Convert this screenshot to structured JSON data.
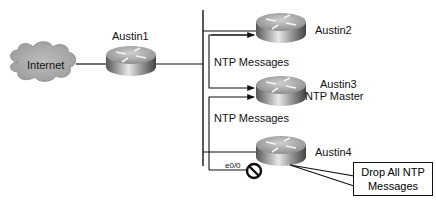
{
  "diagram": {
    "type": "network-topology",
    "nodes": {
      "internet": {
        "label": "Internet"
      },
      "austin1": {
        "label": "Austin1"
      },
      "austin2": {
        "label": "Austin2"
      },
      "austin3": {
        "label": "Austin3",
        "role": "NTP Master"
      },
      "austin4": {
        "label": "Austin4"
      }
    },
    "edges": {
      "ntp_messages_1": "NTP Messages",
      "ntp_messages_2": "NTP Messages",
      "interface": "e0/0"
    },
    "callout": {
      "line1": "Drop All NTP",
      "line2": "Messages"
    },
    "colors": {
      "cloud": "#a9a9a9",
      "router_top": "#b8b8b8",
      "line": "#111111"
    }
  }
}
